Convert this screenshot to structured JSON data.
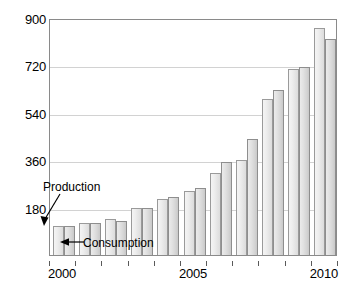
{
  "chart_data": {
    "type": "bar",
    "title": "",
    "subtitle": "",
    "xlabel": "",
    "ylabel": "",
    "categories": [
      "2000",
      "2001",
      "2002",
      "2003",
      "2004",
      "2005",
      "2006",
      "2007",
      "2008",
      "2009",
      "2010"
    ],
    "series": [
      {
        "name": "Production",
        "values": [
          110,
          122,
          137,
          178,
          213,
          243,
          310,
          360,
          592,
          705,
          862
        ]
      },
      {
        "name": "Consumption",
        "values": [
          110,
          120,
          130,
          178,
          222,
          253,
          352,
          440,
          625,
          714,
          820
        ]
      }
    ],
    "ylim": [
      0,
      900
    ],
    "yticks": [
      180,
      360,
      540,
      720,
      900
    ],
    "ytick_labels": [
      "180",
      "360",
      "540",
      "720",
      "900"
    ],
    "xticks": [
      "2000",
      "2005",
      "2010"
    ],
    "xtick_labels": [
      "2000",
      "2005",
      "2010"
    ],
    "grid": true,
    "grid_axis": "y",
    "legend": "none",
    "annotations": [
      {
        "text": "Production",
        "target": "first production bar (year 2000)",
        "arrow": "down-right"
      },
      {
        "text": "Consumption",
        "target": "second consumption bar (year 2001)",
        "arrow": "left"
      }
    ],
    "colors": {
      "production_fill": "#eeeeee",
      "consumption_fill": "#dcdcdc",
      "bar_border": "#9a9a9a",
      "gridline": "#d2d2d2",
      "frame": "#8a8a8a",
      "text": "#000000"
    }
  }
}
